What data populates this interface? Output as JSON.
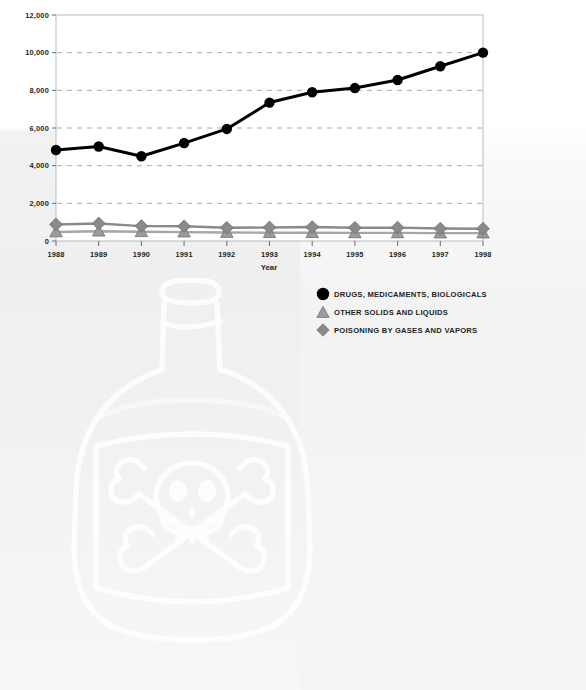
{
  "chart_data": {
    "type": "line",
    "title": "",
    "subtitle": "",
    "xlabel": "Year",
    "ylabel": "",
    "categories": [
      "1988",
      "1989",
      "1990",
      "1991",
      "1992",
      "1993",
      "1994",
      "1995",
      "1996",
      "1997",
      "1998"
    ],
    "x": [
      1988,
      1989,
      1990,
      1991,
      1992,
      1993,
      1994,
      1995,
      1996,
      1997,
      1998
    ],
    "ylim": [
      0,
      12000
    ],
    "xlim": [
      1988,
      1998
    ],
    "yticks": [
      0,
      2000,
      4000,
      6000,
      8000,
      10000,
      12000
    ],
    "ytick_labels": [
      "0",
      "2,000",
      "4,000",
      "6,000",
      "8,000",
      "10,000",
      "12,000"
    ],
    "grid": "horizontal-dashed",
    "legend_position": "below-right",
    "series": [
      {
        "name": "DRUGS, MEDICAMENTS, BIOLOGICALS",
        "marker": "circle",
        "color": "#000000",
        "values": [
          4830,
          5020,
          4500,
          5200,
          5950,
          7350,
          7900,
          8120,
          8550,
          9280,
          10000
        ]
      },
      {
        "name": "OTHER SOLIDS AND LIQUIDS",
        "marker": "triangle",
        "color": "#9b9b9b",
        "values": [
          480,
          520,
          490,
          470,
          450,
          440,
          440,
          430,
          430,
          420,
          420
        ]
      },
      {
        "name": "POISONING BY GASES AND VAPORS",
        "marker": "diamond",
        "color": "#8a8a8a",
        "values": [
          880,
          930,
          790,
          780,
          700,
          720,
          740,
          700,
          710,
          660,
          650
        ]
      }
    ]
  },
  "axes": {
    "y_tick_labels": [
      "12,000",
      "10,000",
      "8,000",
      "6,000",
      "4,000",
      "2,000",
      "0"
    ],
    "x_tick_labels": [
      "1988",
      "1989",
      "1990",
      "1991",
      "1992",
      "1993",
      "1994",
      "1995",
      "1996",
      "1997",
      "1998"
    ],
    "x_axis_title": "Year"
  },
  "legend": {
    "items": [
      {
        "label": "DRUGS, MEDICAMENTS, BIOLOGICALS",
        "marker": "circle",
        "color": "#000000"
      },
      {
        "label": "OTHER SOLIDS AND LIQUIDS",
        "marker": "triangle",
        "color": "#9b9b9b"
      },
      {
        "label": "POISONING BY GASES AND VAPORS",
        "marker": "diamond",
        "color": "#8a8a8a"
      }
    ]
  },
  "watermark": {
    "name": "poison-bottle-skull-crossbones",
    "color": "#ffffff"
  },
  "colors": {
    "series_black": "#000000",
    "series_triangle_gray": "#9b9b9b",
    "series_diamond_gray": "#8a8a8a",
    "grid": "#9aa7b5",
    "axis": "#8c8c8c",
    "text": "#231f20",
    "background": "#f2f2f2"
  }
}
